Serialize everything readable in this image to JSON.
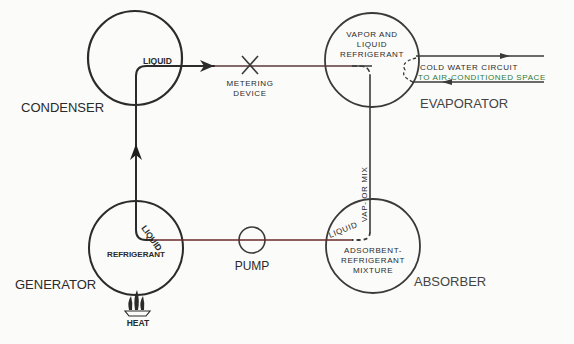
{
  "diagram": {
    "components": {
      "condenser": {
        "label": "CONDENSER",
        "inner_label": "LIQUID"
      },
      "metering_device": {
        "label_line1": "METERING",
        "label_line2": "DEVICE"
      },
      "evaporator": {
        "label": "EVAPORATOR",
        "inner_line1": "VAPOR AND",
        "inner_line2": "LIQUID",
        "inner_line3": "REFRIGERANT"
      },
      "cold_water": {
        "line1": "COLD WATER CIRCUIT",
        "line2": "TO AIR-CONDITIONED SPACE"
      },
      "absorber": {
        "label": "ABSORBER",
        "inner_line1": "ADSORBENT-",
        "inner_line2": "REFRIGERANT",
        "inner_line3": "MIXTURE",
        "pipe_label": "LIQUID"
      },
      "vapor_mix": {
        "label": "VAP- OR MIX"
      },
      "generator": {
        "label": "GENERATOR",
        "inner_label": "REFRIGERANT",
        "pipe_label": "LIQUID"
      },
      "pump": {
        "label": "PUMP"
      },
      "heat": {
        "label": "HEAT"
      }
    },
    "colors": {
      "line": "#2b2b2b",
      "hot_line": "#6a2a2a",
      "accent_green": "#2f7a3a",
      "background": "#fbfbf9"
    }
  }
}
